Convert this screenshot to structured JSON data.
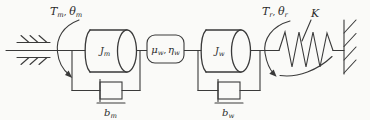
{
  "figure": {
    "bg_color": "#fafaf8",
    "ink_color": "#3a3a3a",
    "text_color": "#2b2b2b"
  },
  "labels": {
    "motor_torque": {
      "symbol": "T",
      "symbol_sub": "m",
      "comma": ",",
      "theta": "θ",
      "theta_sub": "m"
    },
    "motor_inertia": {
      "symbol": "J",
      "sub": "m"
    },
    "gear": {
      "mu": "μ",
      "mu_sub": "w",
      "comma": ",",
      "eta": "η",
      "eta_sub": "w"
    },
    "motor_damping": {
      "symbol": "b",
      "sub": "m"
    },
    "wheel_inertia": {
      "symbol": "J",
      "sub": "w"
    },
    "wheel_damping": {
      "symbol": "b",
      "sub": "w"
    },
    "output_torque": {
      "symbol": "T",
      "symbol_sub": "r",
      "comma": ",",
      "theta": "θ",
      "theta_sub": "r"
    },
    "spring_stiffness": {
      "symbol": "K"
    }
  }
}
